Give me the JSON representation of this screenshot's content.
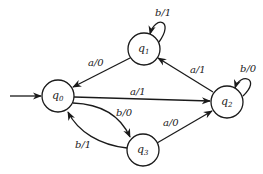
{
  "diagram": {
    "type": "mealy-state-machine",
    "initial_state": "q0",
    "states": [
      {
        "id": "q0",
        "name": "q",
        "sub": "0",
        "cx": 58,
        "cy": 96
      },
      {
        "id": "q1",
        "name": "q",
        "sub": "1",
        "cx": 144,
        "cy": 49
      },
      {
        "id": "q2",
        "name": "q",
        "sub": "2",
        "cx": 227,
        "cy": 102
      },
      {
        "id": "q3",
        "name": "q",
        "sub": "3",
        "cx": 143,
        "cy": 150
      }
    ],
    "transitions": [
      {
        "from": "q1",
        "to": "q1",
        "label": "b/1"
      },
      {
        "from": "q1",
        "to": "q0",
        "label": "a/0"
      },
      {
        "from": "q2",
        "to": "q1",
        "label": "a/1"
      },
      {
        "from": "q2",
        "to": "q2",
        "label": "b/0"
      },
      {
        "from": "q0",
        "to": "q2",
        "label": "a/1"
      },
      {
        "from": "q0",
        "to": "q3",
        "label": "b/0"
      },
      {
        "from": "q3",
        "to": "q0",
        "label": "b/1"
      },
      {
        "from": "q3",
        "to": "q2",
        "label": "a/0"
      }
    ]
  }
}
